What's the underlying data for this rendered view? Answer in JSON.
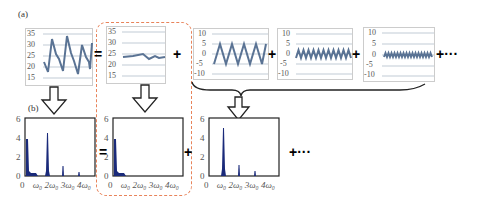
{
  "panel_labels": {
    "a": "(a)",
    "b": "(b)"
  },
  "operators": {
    "equals": "=",
    "plus": "+",
    "ellipsis": "+···"
  },
  "colors": {
    "signal_line": "#5a7394",
    "spectrum_fill": "#1a2a7a",
    "dashed_box": "#e8835a",
    "grid": "#9ab",
    "frame": "#bbb"
  },
  "time_plots": [
    {
      "name": "original-signal",
      "yticks": [
        "35",
        "30",
        "25",
        "20",
        "15"
      ],
      "description": "sawtooth-like oscillation between ~17 and ~33"
    },
    {
      "name": "mean-component",
      "yticks": [
        "35",
        "30",
        "25",
        "20",
        "15"
      ],
      "description": "slow varying line around 25"
    },
    {
      "name": "harmonic-1",
      "yticks": [
        "10",
        "5",
        "0",
        "-5",
        "-10"
      ],
      "description": "sine, amplitude 5, 4 cycles"
    },
    {
      "name": "harmonic-2",
      "yticks": [
        "10",
        "5",
        "0",
        "-5",
        "-10"
      ],
      "description": "sine, amplitude ~2, 10 cycles"
    },
    {
      "name": "harmonic-3",
      "yticks": [
        "10",
        "5",
        "0",
        "-5",
        "-10"
      ],
      "description": "sine, amplitude ~1, 16 cycles"
    }
  ],
  "spectrum_plots": [
    {
      "name": "original-spectrum",
      "yticks": [
        "6",
        "4",
        "2",
        "0"
      ],
      "xticks": [
        "0",
        "ω₀",
        "2ω₀",
        "3ω₀",
        "4ω₀"
      ]
    },
    {
      "name": "mean-spectrum",
      "yticks": [
        "6",
        "4",
        "2",
        "0"
      ],
      "xticks": [
        "0",
        "ω₀",
        "2ω₀",
        "3ω₀",
        "4ω₀"
      ]
    },
    {
      "name": "harmonics-spectrum",
      "yticks": [
        "6",
        "4",
        "2",
        "0"
      ],
      "xticks": [
        "0",
        "ω₀",
        "2ω₀",
        "3ω₀",
        "4ω₀"
      ]
    }
  ]
}
